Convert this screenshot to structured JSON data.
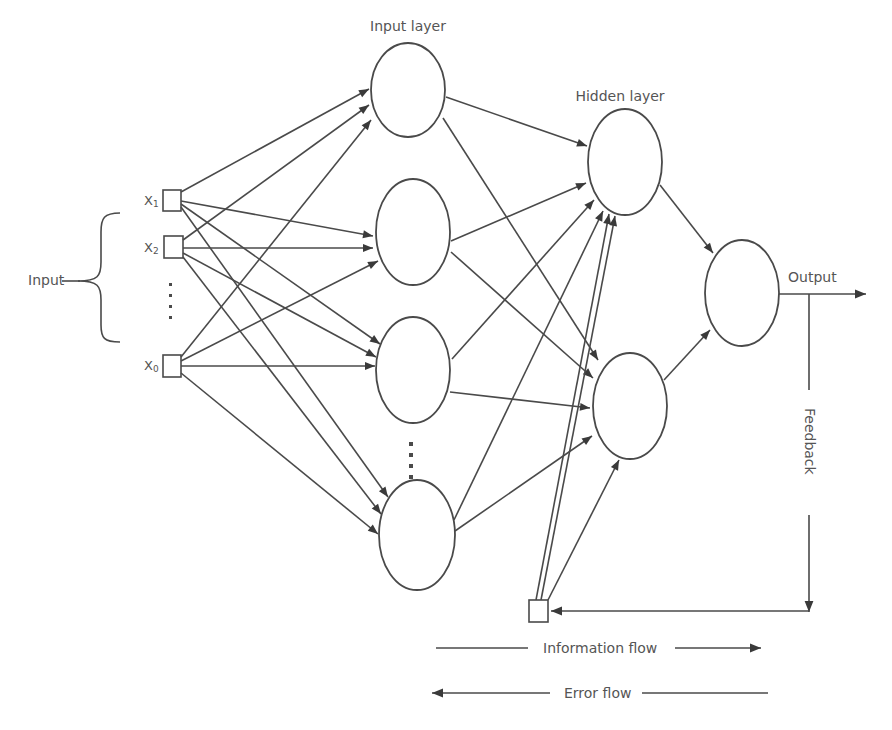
{
  "diagram": {
    "type": "neural-network",
    "labels": {
      "input_group": "Input",
      "input_layer": "Input layer",
      "hidden_layer": "Hidden layer",
      "output": "Output",
      "feedback": "Feedback",
      "information_flow": "Information flow",
      "error_flow": "Error flow"
    },
    "inputs": [
      {
        "id": "x1",
        "label": "X",
        "sub": "1"
      },
      {
        "id": "x2",
        "label": "X",
        "sub": "2"
      },
      {
        "id": "xn",
        "label": "X",
        "sub": "0"
      }
    ],
    "input_ellipsis": "⋮",
    "input_layer_nodes": 4,
    "input_layer_ellipsis": "⋮",
    "hidden_layer_nodes": 2,
    "output_nodes": 1,
    "colors": {
      "stroke": "#4a4a4a",
      "text": "#555555",
      "background": "#ffffff"
    }
  }
}
